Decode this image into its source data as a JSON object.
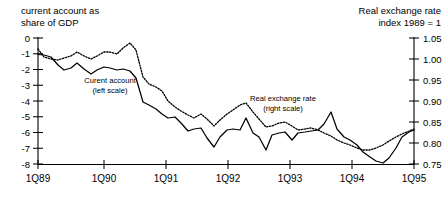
{
  "chart_data": {
    "type": "line",
    "title": "",
    "left_axis": {
      "label_line1": "current account as",
      "label_line2": "share of GDP",
      "ticks": [
        "0",
        "-1",
        "-2",
        "-3",
        "-4",
        "-5",
        "-6",
        "-7",
        "-8"
      ],
      "tick_values": [
        0,
        -1,
        -2,
        -3,
        -4,
        -5,
        -6,
        -7,
        -8
      ],
      "ylim": [
        -8,
        0
      ],
      "ylabel": "current account as share of GDP"
    },
    "right_axis": {
      "label_line1": "Real exchange rate",
      "label_line2": "index 1989 = 1",
      "ticks": [
        "1.05",
        "1.00",
        "0.95",
        "0.90",
        "0.85",
        "0.80",
        "0.75"
      ],
      "tick_values": [
        1.05,
        1.0,
        0.95,
        0.9,
        0.85,
        0.8,
        0.75
      ],
      "ylim": [
        0.75,
        1.05
      ],
      "ylabel": "Real exchange rate index 1989 = 1"
    },
    "xlabel": "",
    "x_tick_labels": [
      "1Q89",
      "1Q90",
      "1Q91",
      "1Q92",
      "1Q93",
      "1Q94",
      "1Q95"
    ],
    "x_tick_values": [
      0,
      4,
      8,
      12,
      16,
      20,
      24
    ],
    "xlim": [
      0,
      25
    ],
    "grid": false,
    "legend_position": "inline-annotations",
    "annotations": [
      {
        "name": "current-account-annotation",
        "line1": "Curent account",
        "line2": "(left scale)",
        "x": 110,
        "y": 83
      },
      {
        "name": "real-exchange-rate-annotation",
        "line1": "Real exchange rate",
        "line2": "(right scale)",
        "x": 283,
        "y": 101
      }
    ],
    "series": [
      {
        "name": "Current account (share of GDP)",
        "style": "solid",
        "axis": "left",
        "x": [
          0,
          1,
          2,
          3,
          4,
          5,
          6,
          7,
          8,
          9,
          10,
          11,
          12,
          13,
          14,
          15,
          16,
          17,
          18,
          19,
          20,
          21,
          22,
          23,
          24
        ],
        "values": [
          -1.0,
          -1.05,
          -1.2,
          -1.75,
          -2.0,
          -1.9,
          -1.55,
          -1.95,
          -2.3,
          -2.0,
          -1.8,
          -1.85,
          -2.0,
          -1.95,
          -2.05,
          -2.6,
          -4.05,
          -4.3,
          -4.6,
          -5.0,
          -5.25,
          -5.2,
          -5.6,
          -6.2,
          -6.0
        ]
      },
      {
        "name": "Real exchange rate (index 1989 = 1)",
        "style": "dotted",
        "axis": "right",
        "x": [
          0,
          1,
          2,
          3,
          4,
          5,
          6,
          7,
          8,
          9,
          10,
          11,
          12,
          13,
          14,
          15,
          16,
          17,
          18,
          19,
          20,
          21,
          22,
          23,
          24
        ],
        "values": [
          1.018,
          0.985,
          0.972,
          0.968,
          0.98,
          0.985,
          1.0,
          0.985,
          0.975,
          0.985,
          0.995,
          0.995,
          0.99,
          1.005,
          1.02,
          0.995,
          0.935,
          0.915,
          0.905,
          0.895,
          0.87,
          0.855,
          0.845,
          0.835,
          0.828
        ]
      },
      {
        "name": "Current account (share of GDP) continued",
        "style": "solid-tail",
        "axis": "left",
        "x": [
          24,
          25,
          26,
          27,
          28,
          29,
          30,
          31,
          32,
          33,
          34,
          35,
          36
        ],
        "values": [
          -6.0,
          -5.95,
          -6.6,
          -7.2,
          -6.5,
          -6.1,
          -6.05,
          -6.1,
          -5.2,
          -6.35,
          -6.6,
          -7.5,
          -6.1
        ]
      }
    ],
    "solid_points_px": [
      [
        38,
        54.5
      ],
      [
        44,
        55
      ],
      [
        51,
        57
      ],
      [
        58,
        65
      ],
      [
        64,
        70
      ],
      [
        71,
        68
      ],
      [
        77,
        63
      ],
      [
        84,
        69
      ],
      [
        91,
        74
      ],
      [
        97,
        70
      ],
      [
        104,
        67
      ],
      [
        110,
        68
      ],
      [
        117,
        70
      ],
      [
        123,
        69
      ],
      [
        130,
        71
      ],
      [
        136,
        78
      ],
      [
        143,
        102
      ],
      [
        149,
        105
      ],
      [
        156,
        109
      ],
      [
        162,
        114
      ],
      [
        168,
        118
      ],
      [
        175,
        117
      ],
      [
        181,
        123
      ],
      [
        188,
        131
      ],
      [
        194,
        129
      ],
      [
        201,
        128
      ],
      [
        207,
        138
      ],
      [
        214,
        147
      ],
      [
        220,
        137
      ],
      [
        227,
        130
      ],
      [
        233,
        129
      ],
      [
        240,
        130
      ],
      [
        246,
        118
      ],
      [
        253,
        133
      ],
      [
        259,
        137
      ],
      [
        266,
        150
      ],
      [
        272,
        135
      ],
      [
        279,
        133
      ],
      [
        285,
        132
      ],
      [
        292,
        140
      ],
      [
        298,
        133
      ],
      [
        305,
        132
      ],
      [
        311,
        131
      ],
      [
        318,
        130
      ],
      [
        324,
        124
      ],
      [
        331,
        112
      ],
      [
        337,
        129
      ],
      [
        344,
        137
      ],
      [
        350,
        140
      ],
      [
        357,
        145
      ],
      [
        363,
        152
      ],
      [
        370,
        157
      ],
      [
        376,
        161
      ],
      [
        383,
        163
      ],
      [
        389,
        158
      ],
      [
        396,
        148
      ],
      [
        402,
        137
      ],
      [
        409,
        132
      ],
      [
        414,
        130
      ]
    ],
    "dotted_points_px": [
      [
        38,
        49
      ],
      [
        44,
        57
      ],
      [
        51,
        59
      ],
      [
        58,
        60
      ],
      [
        64,
        58
      ],
      [
        71,
        56
      ],
      [
        77,
        52
      ],
      [
        84,
        56
      ],
      [
        91,
        59
      ],
      [
        97,
        56
      ],
      [
        104,
        52
      ],
      [
        110,
        52
      ],
      [
        117,
        54
      ],
      [
        123,
        48
      ],
      [
        130,
        43
      ],
      [
        136,
        50
      ],
      [
        143,
        77
      ],
      [
        149,
        84
      ],
      [
        156,
        87
      ],
      [
        162,
        91
      ],
      [
        168,
        101
      ],
      [
        175,
        107
      ],
      [
        181,
        111
      ],
      [
        188,
        115
      ],
      [
        194,
        118
      ],
      [
        201,
        114
      ],
      [
        207,
        119
      ],
      [
        214,
        126
      ],
      [
        220,
        120
      ],
      [
        227,
        114
      ],
      [
        233,
        110
      ],
      [
        240,
        105
      ],
      [
        246,
        103
      ],
      [
        253,
        112
      ],
      [
        259,
        119
      ],
      [
        266,
        127
      ],
      [
        272,
        126
      ],
      [
        279,
        123
      ],
      [
        285,
        122
      ],
      [
        292,
        126
      ],
      [
        298,
        130
      ],
      [
        305,
        129
      ],
      [
        311,
        128
      ],
      [
        318,
        130
      ],
      [
        324,
        133
      ],
      [
        331,
        136
      ],
      [
        337,
        140
      ],
      [
        344,
        143
      ],
      [
        350,
        145
      ],
      [
        357,
        148
      ],
      [
        363,
        150
      ],
      [
        370,
        150
      ],
      [
        376,
        148
      ],
      [
        383,
        145
      ],
      [
        389,
        141
      ],
      [
        396,
        137
      ],
      [
        402,
        134
      ],
      [
        409,
        131
      ],
      [
        414,
        129
      ]
    ]
  }
}
